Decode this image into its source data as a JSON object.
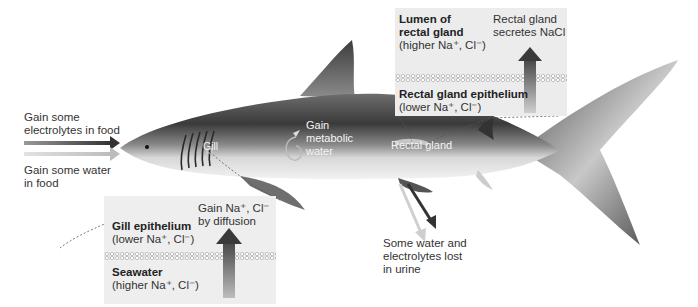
{
  "food": {
    "electrolytes_label": [
      "Gain some",
      "electrolytes in food"
    ],
    "water_label": [
      "Gain some water",
      "in food"
    ]
  },
  "shark_labels": {
    "gill": "Gill",
    "metabolic_water": [
      "Gain",
      "metabolic",
      "water"
    ],
    "rectal_gland": "Rectal gland"
  },
  "rectal_box": {
    "lumen_title": [
      "Lumen of",
      "rectal gland"
    ],
    "lumen_sub": "(higher Na⁺, Cl⁻)",
    "secretes": [
      "Rectal gland",
      "secretes NaCl"
    ],
    "epithelium_title": "Rectal gland epithelium",
    "epithelium_sub": "(lower Na⁺, Cl⁻)"
  },
  "gill_box": {
    "diffusion": [
      "Gain Na⁺, Cl⁻",
      "by diffusion"
    ],
    "epithelium_title": "Gill epithelium",
    "epithelium_sub": "(lower Na⁺, Cl⁻)",
    "seawater_title": "Seawater",
    "seawater_sub": "(higher Na⁺, Cl⁻)"
  },
  "urine": [
    "Some water and",
    "electrolytes lost",
    "in urine"
  ]
}
